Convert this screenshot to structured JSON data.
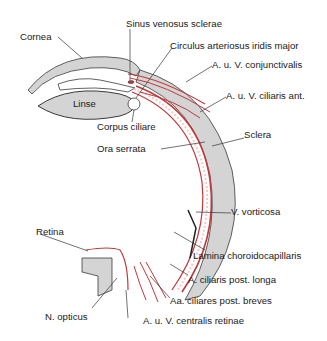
{
  "diagram": {
    "colors": {
      "tissue_gray": "#d4d4d4",
      "outline": "#3a3a3a",
      "vessel_red": "#c0393b",
      "vessel_light": "#f2c9c9",
      "background": "#ffffff"
    },
    "labels": {
      "cornea": "Cornea",
      "sinus": "Sinus venosus sclerae",
      "circulus": "Circulus arteriosus iridis major",
      "conjunctivalis": "A. u. V. conjunctivalis",
      "linse": "Linse",
      "ciliaris_ant": "A. u. V. ciliaris ant.",
      "corpus_ciliare": "Corpus ciliare",
      "ora_serrata": "Ora serrata",
      "sclera": "Sclera",
      "v_vorticosa": "V. vorticosa",
      "lamina": "Lamina choroidocapillaris",
      "retina": "Retina",
      "ciliaris_post_longa": "A. ciliaris post. longa",
      "ciliares_post_breves": "Aa. ciliares post. breves",
      "n_opticus": "N. opticus",
      "centralis_retinae": "A. u. V. centralis retinae"
    }
  }
}
